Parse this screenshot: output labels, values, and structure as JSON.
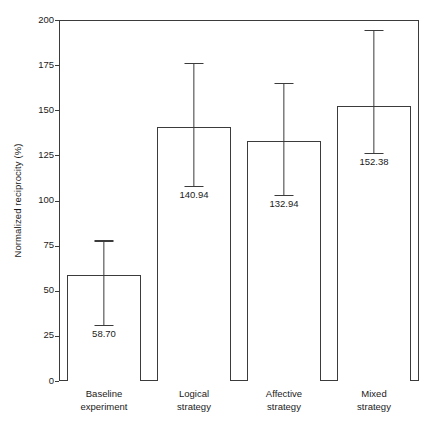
{
  "chart_data": {
    "type": "bar",
    "title": "",
    "subtitle": "",
    "xlabel": "",
    "ylabel": "Normalized reciprocity (%)",
    "categories": [
      "Baseline experiment",
      "Logical strategy",
      "Affective strategy",
      "Mixed strategy"
    ],
    "category_lines": [
      [
        "Baseline",
        "experiment"
      ],
      [
        "Logical",
        "strategy"
      ],
      [
        "Affective",
        "strategy"
      ],
      [
        "Mixed",
        "strategy"
      ]
    ],
    "values": [
      58.7,
      140.94,
      132.94,
      152.38
    ],
    "value_labels": [
      "58.70",
      "140.94",
      "132.94",
      "152.38"
    ],
    "error_bars": {
      "upper": [
        78.0,
        176.4,
        165.1,
        194.5
      ],
      "lower": [
        31.0,
        108.0,
        103.1,
        126.4
      ]
    },
    "ylim": [
      0,
      200
    ],
    "yticks": [
      0,
      25,
      50,
      75,
      100,
      125,
      150,
      175,
      200
    ],
    "ytick_labels": [
      "0",
      "25",
      "50",
      "75",
      "100",
      "125",
      "150",
      "175",
      "200"
    ],
    "grid": false,
    "legend": null,
    "colors": {
      "bar_fill": "#ffffff",
      "bar_edge": "#3b3b3b",
      "error_bar": "#3b3b3b",
      "text": "#1a1a1a",
      "background": "#ffffff"
    }
  }
}
